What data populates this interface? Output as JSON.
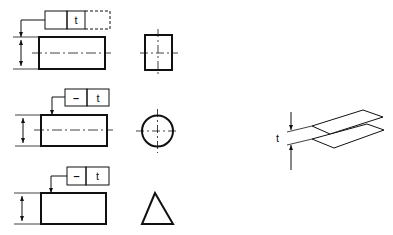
{
  "diagram": {
    "rows": [
      {
        "frame": {
          "symbol": "",
          "tolerance": "t",
          "has_dashed_cell": true
        },
        "section_shape": "rectangle"
      },
      {
        "frame": {
          "symbol": "–",
          "tolerance": "t",
          "has_dashed_cell": false
        },
        "section_shape": "circle"
      },
      {
        "frame": {
          "symbol": "–",
          "tolerance": "t",
          "has_dashed_cell": false
        },
        "section_shape": "triangle"
      }
    ],
    "tolerance_zone": {
      "label": "t",
      "description": "two parallel planes distance t apart"
    }
  },
  "colors": {
    "line": "#111111",
    "background": "#ffffff"
  }
}
